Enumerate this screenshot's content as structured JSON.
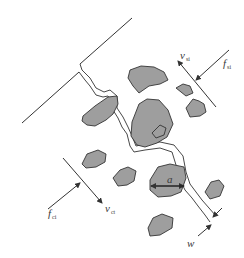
{
  "diagram": {
    "colors": {
      "line": "#333333",
      "particle_fill": "#9a9a9a",
      "background": "#ffffff"
    },
    "labels": {
      "v_top": {
        "main": "v",
        "sub": "si"
      },
      "f_top": {
        "main": "f",
        "sub": "si"
      },
      "f_bottom": {
        "main": "f",
        "sub": "ci"
      },
      "v_bottom": {
        "main": "v",
        "sub": "ct"
      },
      "particle_size": {
        "main": "a",
        "sub": ""
      },
      "crack_width": {
        "main": "w",
        "sub": ""
      }
    }
  }
}
